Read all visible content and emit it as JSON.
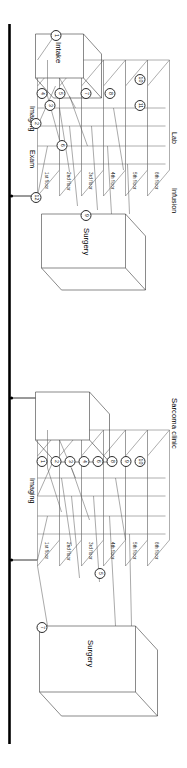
{
  "figure": {
    "type": "architectural-patient-flow-diagram",
    "orientation": "rotated-90-ccw",
    "background": "#ffffff",
    "line_color": "#5a5a5a",
    "axis_color": "#000000"
  },
  "panels": [
    {
      "id": "panel-right",
      "name": "sarcoma-clinic-panel",
      "clinic_label": "Sarcoma clinic",
      "floors": [
        "1st floor",
        "2nd floor",
        "3rd floor",
        "4th floor",
        "5th floor",
        "6th floor"
      ],
      "departments": [
        "Imaging",
        "Surgery"
      ],
      "steps": [
        "1",
        "2",
        "3",
        "4",
        "6",
        "8",
        "9",
        "10",
        "5",
        "7"
      ],
      "outbuildings": [
        "Surgery",
        "Sarcoma clinic"
      ],
      "surgery_step": "7",
      "imaging_step": "5"
    },
    {
      "id": "panel-left",
      "name": "general-clinic-panel",
      "clinic_label": "",
      "floors": [
        "1st floor",
        "2nd floor",
        "3rd floor",
        "4th floor",
        "5th floor",
        "6th floor"
      ],
      "departments": [
        "Imaging",
        "Exam",
        "Lab",
        "Infusion",
        "Surgery",
        "Intake"
      ],
      "steps": [
        "4",
        "5",
        "7",
        "8",
        "10",
        "11",
        "3",
        "2",
        "6",
        "9",
        "1",
        "12"
      ],
      "outbuildings": [
        "Surgery",
        "Intake"
      ],
      "surgery_step": "9",
      "lab_step": "6",
      "intake_step": "1"
    }
  ],
  "labels": {
    "floor_1": "1st floor",
    "floor_2": "2nd floor",
    "floor_3": "3rd floor",
    "floor_4": "4th floor",
    "floor_5": "5th floor",
    "floor_6": "6th floor",
    "surgery": "Surgery",
    "imaging": "Imaging",
    "exam": "Exam",
    "lab": "Lab",
    "infusion": "Infusion",
    "intake": "Intake",
    "sarcoma_clinic": "Sarcoma clinic"
  },
  "steps": {
    "right_panel": {
      "s1": "1",
      "s2": "2",
      "s3": "3",
      "s4": "4",
      "s6": "6",
      "s8": "8",
      "s9": "9",
      "s10": "10",
      "s5": "5",
      "s7": "7"
    },
    "left_panel": {
      "s4": "4",
      "s5": "5",
      "s7": "7",
      "s8": "8",
      "s10": "10",
      "s11": "11",
      "s3": "3",
      "s2": "2",
      "s6": "6",
      "s9": "9",
      "s1": "1",
      "s12": "12"
    }
  }
}
